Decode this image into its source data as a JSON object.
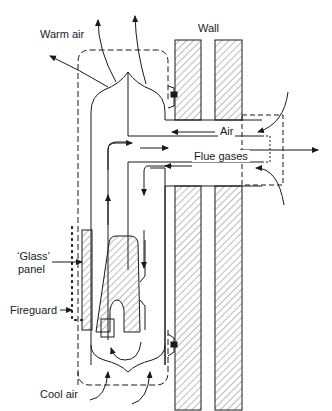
{
  "diagram": {
    "type": "technical-cross-section",
    "labels": {
      "warm_air": "Warm air",
      "wall": "Wall",
      "air": "Air",
      "flue_gases": "Flue gases",
      "glass_panel_line1": "‘Glass’",
      "glass_panel_line2": "panel",
      "fireguard": "Fireguard",
      "cool_air": "Cool air"
    },
    "colors": {
      "line": "#1a1a1a",
      "hatch": "#555555",
      "background": "#ffffff"
    }
  }
}
